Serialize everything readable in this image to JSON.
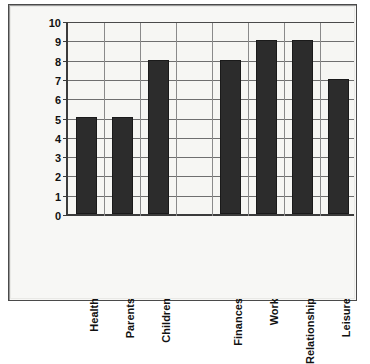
{
  "chart_data": {
    "type": "bar",
    "title": "",
    "xlabel": "",
    "ylabel": "",
    "categories": [
      "Health",
      "Parents",
      "Children",
      "",
      "Finances",
      "Work",
      "Relationship",
      "Leisure"
    ],
    "values": [
      5,
      5,
      8,
      null,
      8,
      9,
      9,
      7
    ],
    "ylim": [
      0,
      10
    ],
    "ytick_labels": [
      "0",
      "1",
      "2",
      "3",
      "4",
      "5",
      "6",
      "7",
      "8",
      "9",
      "10"
    ],
    "grid": true,
    "legend": "none",
    "bar_color": "#2c2c2c",
    "background_color": "#f6f6f3",
    "gridline_color": "#6f6f6f",
    "axis_color": "#3b3b3b",
    "label_rotation": "-90"
  }
}
